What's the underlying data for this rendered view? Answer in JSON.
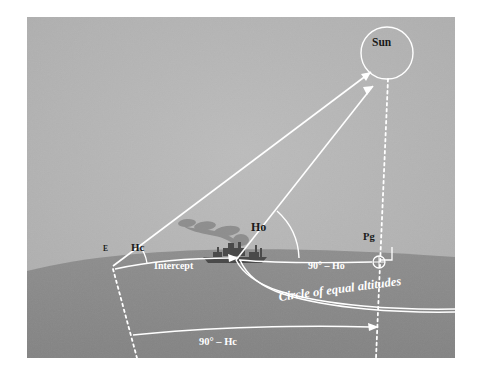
{
  "figure": {
    "background_sky_color": "#b4b4b4",
    "earth_color": "#8a8a8a",
    "line_color": "#ffffff",
    "text_color": "#1a1a1a",
    "labels": {
      "sun": "Sun",
      "assumed_position": "E",
      "computed_altitude": "Hc",
      "observed_altitude": "Ho",
      "geographic_position": "Pg",
      "intercept": "Intercept",
      "co_altitude_observed": "90° – Ho",
      "co_altitude_computed": "90° – Hc",
      "circle_of_equal_altitudes": "Circle of equal altitudes"
    },
    "icons": {
      "sun_body": "sun-circle-icon",
      "ship": "ship-icon",
      "smoke": "smoke-plume-icon",
      "gp_marker": "circled-cross-icon",
      "right_angle": "right-angle-marker-icon"
    }
  }
}
